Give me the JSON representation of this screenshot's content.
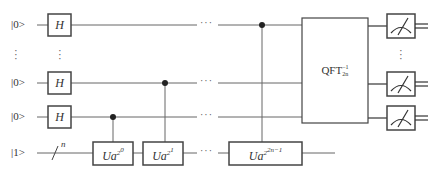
{
  "diagram": {
    "type": "quantum-circuit",
    "title": "",
    "qubits": [
      {
        "id": "q0",
        "label": "|0>",
        "y": 25,
        "gate": "H",
        "control_on": "Ua^{2^{2n-1}}"
      },
      {
        "id": "q_dots",
        "label": "⋮",
        "y": 55
      },
      {
        "id": "q1",
        "label": "|0>",
        "y": 83,
        "gate": "H",
        "control_on": "Ua^{2^1}"
      },
      {
        "id": "q2",
        "label": "|0>",
        "y": 117,
        "gate": "H",
        "control_on": "Ua^{2^0}"
      },
      {
        "id": "target",
        "label": "|1>",
        "y": 153,
        "bus_label": "n"
      }
    ],
    "gates": {
      "hadamard": "H",
      "ua0": {
        "base": "Ua",
        "exp": "2",
        "exp2": "0"
      },
      "ua1": {
        "base": "Ua",
        "exp": "2",
        "exp2": "1"
      },
      "ua_last": {
        "base": "Ua",
        "exp": "2",
        "exp2": "2n−1"
      },
      "qft": {
        "base": "QFT",
        "sup": "−1",
        "sub": "2n"
      }
    },
    "ellipsis_h": "···",
    "ellipsis_v": "⋮",
    "measurements": 3,
    "colors": {
      "line": "#555555",
      "box": "#444444",
      "control": "#222222",
      "background": "#ffffff"
    }
  }
}
